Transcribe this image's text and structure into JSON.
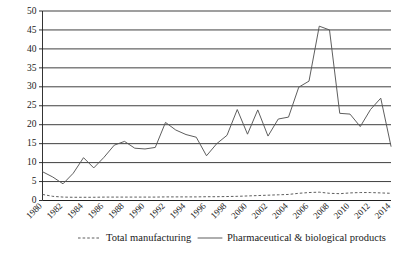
{
  "chart_data": {
    "type": "line",
    "title": "",
    "subtitle": "",
    "xlabel": "",
    "ylabel": "",
    "ylim": [
      0,
      50
    ],
    "ytick_step": 5,
    "yticks": [
      0,
      5,
      10,
      15,
      20,
      25,
      30,
      35,
      40,
      45,
      50
    ],
    "grid": true,
    "grid_axis": "y",
    "legend_position": "bottom",
    "x_tick_labels": [
      "1980",
      "1982",
      "1984",
      "1986",
      "1988",
      "1990",
      "1992",
      "1994",
      "1996",
      "1998",
      "2000",
      "2002",
      "2004",
      "2006",
      "2008",
      "2010",
      "2012",
      "2014"
    ],
    "x": [
      1980,
      1981,
      1982,
      1983,
      1984,
      1985,
      1986,
      1987,
      1988,
      1989,
      1990,
      1991,
      1992,
      1993,
      1994,
      1995,
      1996,
      1997,
      1998,
      1999,
      2000,
      2001,
      2002,
      2003,
      2004,
      2005,
      2006,
      2007,
      2008,
      2009,
      2010,
      2011,
      2012,
      2013,
      2014
    ],
    "series": [
      {
        "name": "Total manufacturing",
        "style": "dashed",
        "color": "#555555",
        "values": [
          1.6,
          1.1,
          0.9,
          0.85,
          0.85,
          0.85,
          0.9,
          0.9,
          0.9,
          0.9,
          0.9,
          0.9,
          0.95,
          0.95,
          0.95,
          0.95,
          1.0,
          1.0,
          1.05,
          1.1,
          1.2,
          1.3,
          1.4,
          1.5,
          1.6,
          1.9,
          2.1,
          2.2,
          1.9,
          1.8,
          2.0,
          2.1,
          2.1,
          2.0,
          1.9
        ]
      },
      {
        "name": "Pharmaceutical & biological products",
        "style": "solid",
        "color": "#555555",
        "values": [
          7.6,
          6.2,
          4.4,
          7.2,
          11.3,
          8.6,
          11.4,
          14.6,
          15.6,
          13.8,
          13.6,
          14.0,
          20.6,
          18.6,
          17.4,
          16.7,
          11.8,
          15.0,
          17.2,
          24.0,
          17.5,
          23.9,
          17.0,
          21.5,
          22.0,
          29.9,
          31.5,
          46.0,
          45.0,
          23.0,
          22.8,
          19.5,
          24.0,
          27.0,
          14.3
        ]
      }
    ]
  },
  "legend": {
    "items": [
      {
        "label": "Total manufacturing",
        "style": "dashed"
      },
      {
        "label": "Pharmaceutical & biological products",
        "style": "solid"
      }
    ]
  }
}
